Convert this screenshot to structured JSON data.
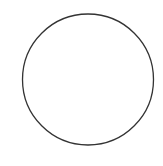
{
  "diagram": {
    "shape": "circle",
    "center": {
      "x": 88,
      "y": 79.5
    },
    "radius": 65.5,
    "stroke_color": "#333333",
    "stroke_width": 1.3,
    "fill_color": "#ffffff",
    "background_color": "#ffffff"
  }
}
